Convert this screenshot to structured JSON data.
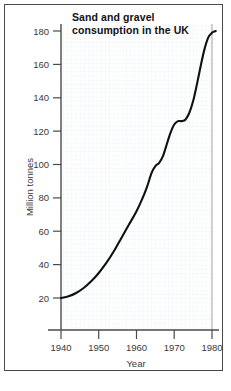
{
  "chart_data": {
    "type": "line",
    "title": "Sand and gravel consumption in the UK",
    "title_line1": "Sand and gravel",
    "title_line2": "consumption in the UK",
    "xlabel": "Year",
    "ylabel": "Million tonnes",
    "xlim": [
      1938,
      1983
    ],
    "ylim": [
      0,
      190
    ],
    "xticks": [
      1940,
      1950,
      1960,
      1970,
      1980
    ],
    "xtick_labels": [
      "1940",
      "1950",
      "1960",
      "1970",
      "1980"
    ],
    "yticks": [
      20,
      40,
      60,
      80,
      100,
      120,
      140,
      160,
      180
    ],
    "ytick_labels": [
      "20",
      "40",
      "60",
      "80",
      "100",
      "120",
      "140",
      "160",
      "180"
    ],
    "grid": true,
    "grid_color": "#e8eef2",
    "legend": null,
    "line_color": "#111111",
    "series": [
      {
        "name": "Sand and gravel consumption",
        "x": [
          1940,
          1942,
          1944,
          1946,
          1948,
          1950,
          1952,
          1954,
          1956,
          1958,
          1960,
          1962,
          1963,
          1964,
          1965,
          1966,
          1967,
          1968,
          1969,
          1970,
          1971,
          1972,
          1973,
          1974,
          1975,
          1976,
          1977,
          1978,
          1979,
          1980,
          1981
        ],
        "y": [
          20,
          21,
          23,
          26,
          30,
          35,
          41,
          48,
          56,
          64,
          72,
          82,
          88,
          95,
          99,
          101,
          105,
          112,
          119,
          124,
          126,
          126,
          127,
          131,
          138,
          148,
          159,
          169,
          176,
          179,
          180
        ]
      }
    ]
  },
  "figure": {
    "background_color": "#ffffff",
    "border_color": "#4a4a4a",
    "axis_color": "#4a4a4a"
  }
}
